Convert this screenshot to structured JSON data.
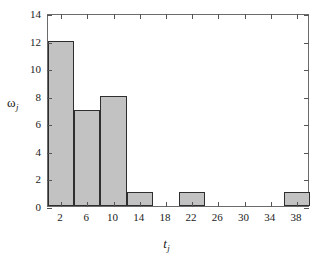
{
  "chart_data": {
    "type": "bar",
    "title": "",
    "subtitle": "",
    "xlabel": "t_j",
    "ylabel": "omega_j",
    "xlabel_base": "t",
    "xlabel_sub": "j",
    "ylabel_base": "ω",
    "ylabel_sub": "j",
    "bin_width": 4,
    "bin_edges": [
      0,
      4,
      8,
      12,
      16,
      20,
      24,
      28,
      32,
      36,
      40
    ],
    "categories": [
      "2",
      "6",
      "10",
      "14",
      "18",
      "22",
      "26",
      "30",
      "34",
      "38"
    ],
    "values": [
      12,
      7,
      8,
      1,
      0,
      1,
      0,
      0,
      0,
      1
    ],
    "xlim": [
      0,
      40
    ],
    "ylim": [
      0,
      14
    ],
    "xticks": [
      2,
      6,
      10,
      14,
      18,
      22,
      26,
      30,
      34,
      38
    ],
    "xtick_labels": [
      "2",
      "6",
      "10",
      "14",
      "18",
      "22",
      "26",
      "30",
      "34",
      "38"
    ],
    "yticks": [
      0,
      2,
      4,
      6,
      8,
      10,
      12,
      14
    ],
    "ytick_labels": [
      "0",
      "2",
      "4",
      "6",
      "8",
      "10",
      "12",
      "14"
    ],
    "grid": false,
    "legend": false,
    "legend_position": "none",
    "bar_fill_color": "#c2c2c2",
    "bar_edge_color": "#2e2e2e",
    "frame_color": "#6b6b6b",
    "background_color": "#ffffff"
  }
}
